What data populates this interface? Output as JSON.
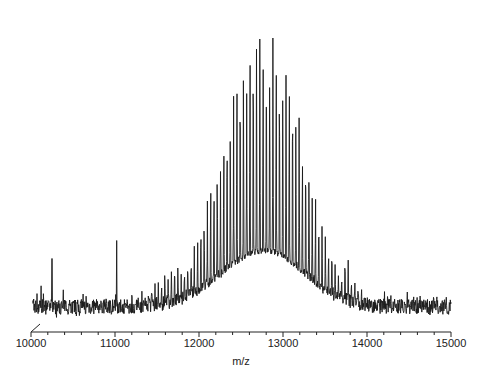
{
  "chart_data": {
    "type": "line",
    "title": "",
    "xlabel": "m/z",
    "ylabel": "",
    "xlim": [
      10000,
      15000
    ],
    "ylim": [
      0,
      100
    ],
    "grid": false,
    "legend": null,
    "x_ticks": [
      10000,
      11000,
      12000,
      13000,
      14000,
      15000
    ],
    "x_tick_labels": [
      "10000",
      "11000",
      "12000",
      "13000",
      "14000",
      "15000"
    ],
    "minor_tick_step": 200,
    "envelope": {
      "center_mz": 12790,
      "sigma_left_mz": 520,
      "sigma_right_mz": 470,
      "peak_spacing_mz": 39,
      "max_relative_intensity": 100,
      "baseline_relative_intensity": 5,
      "base_envelope_max_relative_intensity": 22
    },
    "series": [
      {
        "name": "spectrum",
        "x": [
          10000,
          10500,
          11000,
          11500,
          12000,
          12400,
          12600,
          12790,
          13000,
          13200,
          13500,
          14000,
          14500,
          15000
        ],
        "values": [
          6,
          10,
          13,
          20,
          42,
          72,
          88,
          100,
          90,
          74,
          48,
          18,
          10,
          8
        ]
      }
    ],
    "annotations": [
      {
        "mz": 10120,
        "relative_intensity": 12,
        "note": "noise spike"
      },
      {
        "mz": 10250,
        "relative_intensity": 21,
        "note": "noise spike"
      },
      {
        "mz": 11020,
        "relative_intensity": 27,
        "note": "isolated spike"
      }
    ]
  },
  "axis": {
    "x_title": "m/z",
    "ticks": [
      "10000",
      "11000",
      "12000",
      "13000",
      "14000",
      "15000"
    ]
  },
  "style": {
    "line_color": "#1a1a1a",
    "axis_color": "#222222",
    "background": "#ffffff"
  }
}
